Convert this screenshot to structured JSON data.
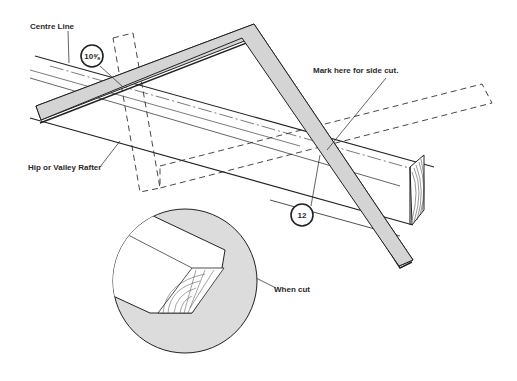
{
  "diagram": {
    "labels": {
      "centre_line": "Centre Line",
      "hip_valley_rafter": "Hip or Valley Rafter",
      "mark_side_cut": "Mark here for side cut.",
      "when_cut": "When cut"
    },
    "callouts": {
      "tongue_reading": "10⅝",
      "blade_reading": "12"
    },
    "colors": {
      "steel_square": "#d4d4d4",
      "detail_circle": "#dcdcdc",
      "line": "#222222"
    }
  }
}
